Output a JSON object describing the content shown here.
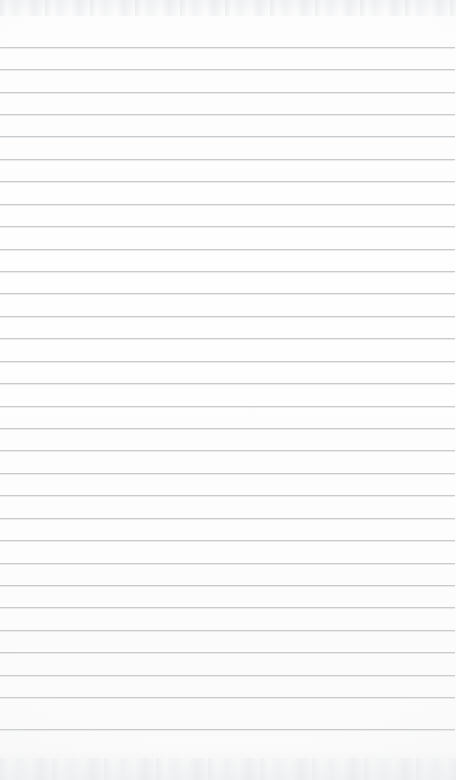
{
  "page": {
    "kind": "ruled-notebook-page",
    "content_text": "",
    "width_px": 456,
    "height_px": 780,
    "paper_color": "#fdfdfd",
    "rule_color": "#c6cacd",
    "rule_count": 31,
    "first_rule_y": 47,
    "rule_spacing_px": 22.5,
    "rule_left_x": 0,
    "rule_right_x": 455,
    "top_margin_px": 47,
    "bottom_margin_px": 51,
    "has_margin_rule": false,
    "has_holes": false,
    "has_header_text": false,
    "has_handwriting": false
  },
  "rules": [
    {
      "index": 1,
      "y": 47
    },
    {
      "index": 2,
      "y": 69
    },
    {
      "index": 3,
      "y": 92
    },
    {
      "index": 4,
      "y": 114
    },
    {
      "index": 5,
      "y": 136
    },
    {
      "index": 6,
      "y": 159
    },
    {
      "index": 7,
      "y": 181
    },
    {
      "index": 8,
      "y": 204
    },
    {
      "index": 9,
      "y": 226
    },
    {
      "index": 10,
      "y": 249
    },
    {
      "index": 11,
      "y": 271
    },
    {
      "index": 12,
      "y": 293
    },
    {
      "index": 13,
      "y": 316
    },
    {
      "index": 14,
      "y": 338
    },
    {
      "index": 15,
      "y": 361
    },
    {
      "index": 16,
      "y": 383
    },
    {
      "index": 17,
      "y": 406
    },
    {
      "index": 18,
      "y": 428
    },
    {
      "index": 19,
      "y": 450
    },
    {
      "index": 20,
      "y": 473
    },
    {
      "index": 21,
      "y": 495
    },
    {
      "index": 22,
      "y": 518
    },
    {
      "index": 23,
      "y": 540
    },
    {
      "index": 24,
      "y": 563
    },
    {
      "index": 25,
      "y": 585
    },
    {
      "index": 26,
      "y": 607
    },
    {
      "index": 27,
      "y": 630
    },
    {
      "index": 28,
      "y": 652
    },
    {
      "index": 29,
      "y": 675
    },
    {
      "index": 30,
      "y": 697
    },
    {
      "index": 31,
      "y": 729
    }
  ]
}
